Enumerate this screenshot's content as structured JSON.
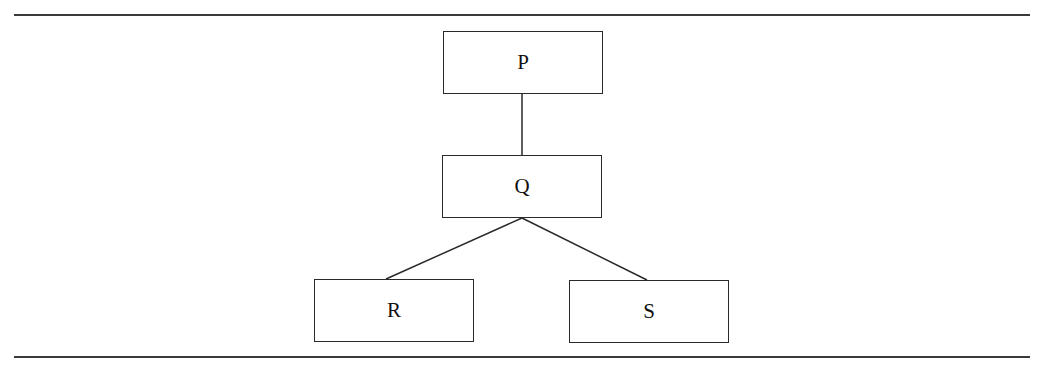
{
  "diagram": {
    "type": "tree",
    "nodes": [
      {
        "id": "P",
        "label": "P"
      },
      {
        "id": "Q",
        "label": "Q"
      },
      {
        "id": "R",
        "label": "R"
      },
      {
        "id": "S",
        "label": "S"
      }
    ],
    "edges": [
      {
        "from": "P",
        "to": "Q"
      },
      {
        "from": "Q",
        "to": "R"
      },
      {
        "from": "Q",
        "to": "S"
      }
    ]
  }
}
